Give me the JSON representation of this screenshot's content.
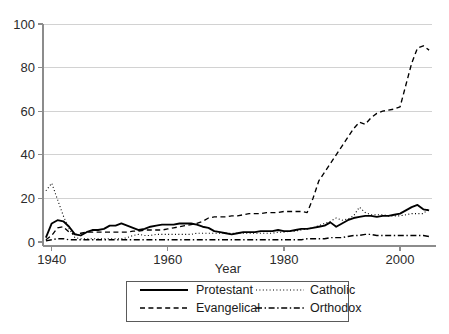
{
  "chart_data": {
    "type": "line",
    "title": "",
    "subtitle": "",
    "xlabel": "Year",
    "ylabel": "",
    "xlim": [
      1938.5,
      2005.5
    ],
    "ylim": [
      0,
      100
    ],
    "xticks": [
      1940,
      1960,
      1980,
      2000
    ],
    "xtick_labels": [
      "1940",
      "1960",
      "1980",
      "2000"
    ],
    "yticks": [
      0,
      20,
      40,
      60,
      80,
      100
    ],
    "ytick_labels": [
      "0",
      "20",
      "40",
      "60",
      "80",
      "100"
    ],
    "grid": "horizontal",
    "legend_position": "below-axis-center",
    "x": [
      1939,
      1940,
      1941,
      1942,
      1943,
      1944,
      1945,
      1946,
      1947,
      1948,
      1949,
      1950,
      1951,
      1952,
      1953,
      1954,
      1955,
      1956,
      1957,
      1958,
      1959,
      1960,
      1961,
      1962,
      1963,
      1964,
      1965,
      1966,
      1967,
      1968,
      1969,
      1970,
      1971,
      1972,
      1973,
      1974,
      1975,
      1976,
      1977,
      1978,
      1979,
      1980,
      1981,
      1982,
      1983,
      1984,
      1985,
      1986,
      1987,
      1988,
      1989,
      1990,
      1991,
      1992,
      1993,
      1994,
      1995,
      1996,
      1997,
      1998,
      1999,
      2000,
      2001,
      2002,
      2003,
      2004,
      2005
    ],
    "series": [
      {
        "name": "Protestant",
        "style": "solid",
        "color": "#000000",
        "values": [
          2.0,
          8.5,
          10.0,
          9.5,
          7.0,
          3.5,
          3.0,
          4.5,
          5.5,
          5.5,
          6.0,
          7.5,
          7.5,
          8.5,
          7.5,
          6.5,
          5.5,
          6.0,
          7.0,
          7.5,
          8.0,
          8.0,
          8.0,
          8.5,
          8.5,
          8.5,
          8.0,
          7.0,
          6.5,
          5.0,
          4.5,
          4.0,
          3.5,
          4.0,
          4.5,
          4.5,
          4.5,
          5.0,
          5.0,
          5.0,
          5.5,
          5.0,
          5.0,
          5.5,
          6.0,
          6.0,
          6.5,
          7.0,
          7.5,
          9.0,
          7.0,
          8.5,
          10.0,
          11.0,
          11.5,
          12.0,
          12.0,
          11.5,
          12.0,
          12.0,
          12.5,
          13.0,
          14.5,
          16.0,
          17.0,
          15.0,
          14.5
        ]
      },
      {
        "name": "Catholic",
        "style": "dotted",
        "color": "#000000",
        "values": [
          23.5,
          27.0,
          19.5,
          12.0,
          6.0,
          2.0,
          1.5,
          1.5,
          1.5,
          1.5,
          1.5,
          1.5,
          1.5,
          1.5,
          2.0,
          3.0,
          3.5,
          3.0,
          3.0,
          3.5,
          3.5,
          3.5,
          3.5,
          3.5,
          3.5,
          3.5,
          4.0,
          4.0,
          4.0,
          4.0,
          4.0,
          4.0,
          4.0,
          4.0,
          4.0,
          4.0,
          4.0,
          4.0,
          4.0,
          4.0,
          4.5,
          4.5,
          5.0,
          5.0,
          5.5,
          6.0,
          6.5,
          7.5,
          8.5,
          9.5,
          11.0,
          10.0,
          10.5,
          12.0,
          16.0,
          13.5,
          12.5,
          12.5,
          12.5,
          12.0,
          12.0,
          12.0,
          12.5,
          13.0,
          13.0,
          13.0,
          15.5
        ]
      },
      {
        "name": "Evangelical",
        "style": "dashed",
        "color": "#000000",
        "values": [
          1.0,
          3.0,
          6.5,
          7.0,
          4.5,
          3.5,
          4.0,
          4.5,
          4.5,
          4.5,
          4.5,
          4.5,
          4.5,
          4.5,
          4.5,
          5.0,
          5.0,
          5.5,
          5.5,
          5.5,
          5.5,
          6.0,
          6.5,
          7.0,
          7.5,
          8.0,
          8.5,
          9.5,
          11.0,
          11.5,
          11.5,
          11.5,
          12.0,
          12.0,
          12.5,
          13.0,
          13.0,
          13.0,
          13.5,
          13.5,
          13.5,
          14.0,
          14.0,
          14.0,
          14.0,
          13.5,
          20.0,
          28.0,
          32.0,
          36.0,
          40.0,
          44.0,
          48.0,
          52.0,
          55.0,
          54.0,
          57.0,
          59.0,
          60.0,
          60.5,
          61.0,
          62.0,
          72.0,
          82.0,
          89.0,
          90.0,
          88.0
        ]
      },
      {
        "name": "Orthodox",
        "style": "dashdot",
        "color": "#000000",
        "values": [
          0.5,
          1.0,
          1.5,
          1.5,
          1.0,
          1.0,
          1.0,
          1.0,
          1.0,
          1.0,
          1.0,
          1.0,
          1.0,
          1.0,
          1.0,
          1.0,
          1.0,
          1.0,
          1.0,
          1.0,
          1.0,
          1.0,
          1.0,
          1.0,
          1.0,
          1.0,
          1.0,
          1.0,
          1.0,
          1.0,
          1.0,
          1.0,
          1.0,
          1.0,
          1.0,
          1.0,
          1.0,
          1.0,
          1.0,
          1.0,
          1.0,
          1.0,
          1.0,
          1.0,
          1.0,
          1.5,
          1.5,
          1.5,
          1.5,
          2.0,
          2.0,
          2.0,
          2.5,
          3.0,
          3.0,
          3.5,
          3.5,
          3.0,
          3.0,
          3.0,
          3.0,
          3.0,
          3.0,
          3.0,
          3.0,
          3.0,
          2.5
        ]
      }
    ]
  },
  "axis": {
    "x_title": "Year",
    "x_tick_labels": [
      "1940",
      "1960",
      "1980",
      "2000"
    ],
    "y_tick_labels": [
      "0",
      "20",
      "40",
      "60",
      "80",
      "100"
    ]
  },
  "legend": {
    "entries": [
      {
        "label": "Protestant",
        "style": "solid"
      },
      {
        "label": "Catholic",
        "style": "dotted"
      },
      {
        "label": "Evangelical",
        "style": "dashed"
      },
      {
        "label": "Orthodox",
        "style": "dashdot"
      }
    ]
  }
}
